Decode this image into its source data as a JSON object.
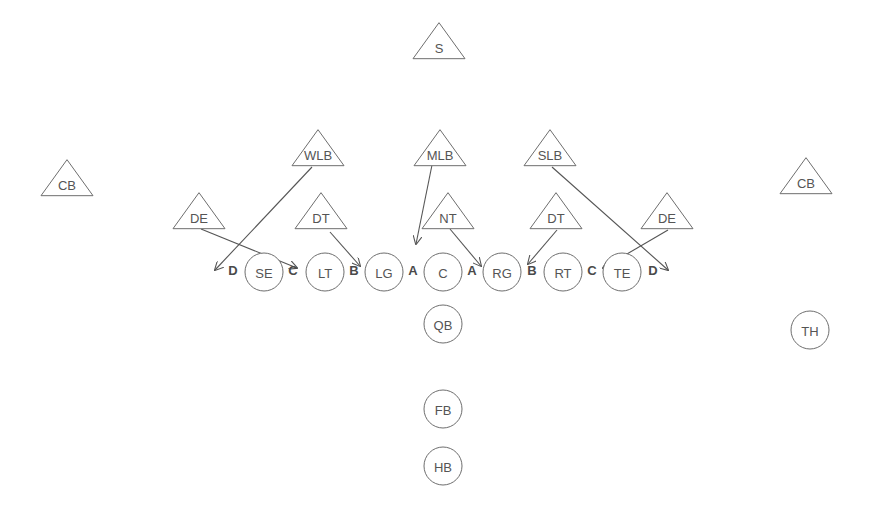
{
  "diagram": {
    "title": "",
    "stroke_color": "#6e6e6e",
    "text_color": "#555555",
    "offense": [
      {
        "id": "SE",
        "label": "SE",
        "x": 264,
        "y": 272
      },
      {
        "id": "LT",
        "label": "LT",
        "x": 325,
        "y": 272
      },
      {
        "id": "LG",
        "label": "LG",
        "x": 384,
        "y": 272
      },
      {
        "id": "C",
        "label": "C",
        "x": 443,
        "y": 272
      },
      {
        "id": "RG",
        "label": "RG",
        "x": 502,
        "y": 272
      },
      {
        "id": "RT",
        "label": "RT",
        "x": 563,
        "y": 272
      },
      {
        "id": "TE",
        "label": "TE",
        "x": 622,
        "y": 272
      },
      {
        "id": "QB",
        "label": "QB",
        "x": 443,
        "y": 324
      },
      {
        "id": "FB",
        "label": "FB",
        "x": 443,
        "y": 409
      },
      {
        "id": "HB",
        "label": "HB",
        "x": 443,
        "y": 466
      },
      {
        "id": "TH",
        "label": "TH",
        "x": 810,
        "y": 330
      }
    ],
    "defense": [
      {
        "id": "S",
        "label": "S",
        "x": 439,
        "y": 45
      },
      {
        "id": "CB_L",
        "label": "CB",
        "x": 67,
        "y": 182
      },
      {
        "id": "CB_R",
        "label": "CB",
        "x": 806,
        "y": 180
      },
      {
        "id": "WLB",
        "label": "WLB",
        "x": 318,
        "y": 152
      },
      {
        "id": "MLB",
        "label": "MLB",
        "x": 440,
        "y": 152
      },
      {
        "id": "SLB",
        "label": "SLB",
        "x": 550,
        "y": 152
      },
      {
        "id": "DE_L",
        "label": "DE",
        "x": 199,
        "y": 215
      },
      {
        "id": "DT_L",
        "label": "DT",
        "x": 321,
        "y": 215
      },
      {
        "id": "NT",
        "label": "NT",
        "x": 448,
        "y": 215
      },
      {
        "id": "DT_R",
        "label": "DT",
        "x": 556,
        "y": 215
      },
      {
        "id": "DE_R",
        "label": "DE",
        "x": 667,
        "y": 215
      }
    ],
    "gaps": [
      {
        "label": "D",
        "x": 233,
        "y": 270
      },
      {
        "label": "C",
        "x": 293,
        "y": 270
      },
      {
        "label": "B",
        "x": 354,
        "y": 270
      },
      {
        "label": "A",
        "x": 413,
        "y": 270
      },
      {
        "label": "A",
        "x": 472,
        "y": 270
      },
      {
        "label": "B",
        "x": 532,
        "y": 270
      },
      {
        "label": "C",
        "x": 592,
        "y": 270
      },
      {
        "label": "D",
        "x": 653,
        "y": 270
      }
    ],
    "routes": [
      {
        "from": "WLB",
        "x1": 312,
        "y1": 167,
        "x2": 215,
        "y2": 270
      },
      {
        "from": "DE_L",
        "x1": 201,
        "y1": 229,
        "x2": 297,
        "y2": 268
      },
      {
        "from": "DT_L",
        "x1": 330,
        "y1": 232,
        "x2": 360,
        "y2": 266
      },
      {
        "from": "MLB",
        "x1": 432,
        "y1": 165,
        "x2": 416,
        "y2": 244
      },
      {
        "from": "NT",
        "x1": 450,
        "y1": 229,
        "x2": 481,
        "y2": 266
      },
      {
        "from": "DT_R",
        "x1": 557,
        "y1": 230,
        "x2": 528,
        "y2": 264
      },
      {
        "from": "SLB",
        "x1": 552,
        "y1": 167,
        "x2": 668,
        "y2": 270
      },
      {
        "from": "DE_R",
        "x1": 668,
        "y1": 230,
        "x2": 603,
        "y2": 268
      }
    ]
  }
}
